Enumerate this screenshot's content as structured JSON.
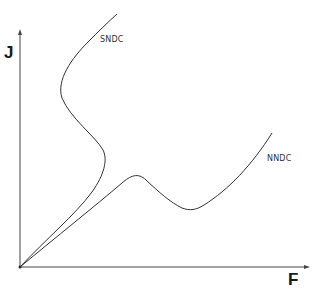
{
  "diagram": {
    "axes": {
      "y_label": "J",
      "x_label": "F"
    },
    "curves": [
      {
        "name": "SNDC",
        "label": "SNDC",
        "shape": "S-shaped"
      },
      {
        "name": "NNDC",
        "label": "NNDC",
        "shape": "N-shaped"
      }
    ],
    "colors": {
      "stroke": "#333333",
      "axis": "#444444",
      "background": "#ffffff"
    }
  }
}
